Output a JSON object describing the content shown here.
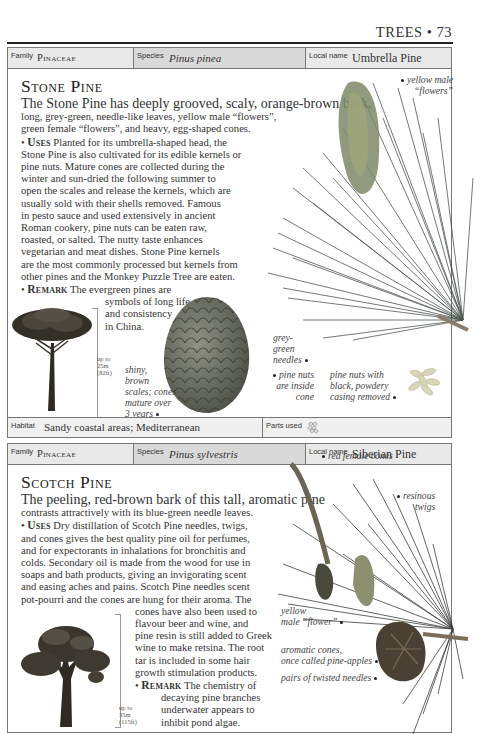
{
  "running_head": "TREES • 73",
  "entries": [
    {
      "family_label": "Family",
      "family": "Pinaceae",
      "species_label": "Species",
      "species": "Pinus pinea",
      "local_name_label": "Local name",
      "local_name": "Umbrella Pine",
      "title": "Stone Pine",
      "body_lines": [
        "The Stone Pine has deeply grooved, scaly, orange-brown bark,",
        "long, grey-green, needle-like leaves, yellow male “flowers”,",
        "green female “flowers”, and heavy, egg-shaped cones."
      ],
      "uses_keyword": "Uses",
      "uses_lines": [
        " Planted for its umbrella-shaped head, the",
        "Stone Pine is also cultivated for its edible kernels or",
        "pine nuts. Mature cones are collected during the",
        "winter and sun-dried the following summer to",
        "open the scales and release the kernels, which are",
        "usually sold with their shells removed. Famous",
        "in pesto sauce and used extensively in ancient",
        "Roman cookery, pine nuts can be eaten raw,",
        "roasted, or salted. The nutty taste enhances",
        "vegetarian and meat dishes. Stone Pine kernels",
        "are the most commonly processed but kernels from",
        "other pines and the Monkey Puzzle Tree are eaten."
      ],
      "remark_keyword": "Remark",
      "remark_first": " The evergreen pines are",
      "remark_lines": [
        "symbols of long life",
        "and consistency",
        "in China."
      ],
      "height": [
        "up to",
        "25m",
        "(82ft)"
      ],
      "captions": {
        "male_flowers": [
          "yellow male",
          "“flowers”"
        ],
        "needles": [
          "grey-",
          "green",
          "needles"
        ],
        "scales": [
          "shiny,",
          "brown",
          "scales; cones",
          "mature over",
          "3 years"
        ],
        "nuts_inside": [
          "pine nuts",
          "are inside",
          "cone"
        ],
        "nuts_removed": [
          "pine nuts with",
          "black, powdery",
          "casing removed"
        ]
      },
      "habitat_label": "Habitat",
      "habitat": "Sandy coastal areas; Mediterranean",
      "parts_used_label": "Parts used",
      "parts_used_icon": "pine-nuts-icon"
    },
    {
      "family_label": "Family",
      "family": "Pinaceae",
      "species_label": "Species",
      "species": "Pinus sylvestris",
      "local_name_label": "Local name",
      "local_name": "Siberian Pine",
      "title": "Scotch Pine",
      "body_lines": [
        "The peeling, red-brown bark of this tall, aromatic pine",
        "contrasts attractively with its blue-green needle leaves."
      ],
      "uses_keyword": "Uses",
      "uses_lines": [
        " Dry distillation of Scotch Pine needles, twigs,",
        "and cones gives the best quality pine oil for perfumes,",
        "and for expectorants in inhalations for bronchitis and",
        "colds. Secondary oil is made from the wood for use in",
        "soaps and bath products, giving an invigorating scent",
        "and easing aches and pains. Scotch Pine needles scent",
        "pot-pourri and the cones are hung for their aroma. The"
      ],
      "uses_indented_lines": [
        "cones have also been used to",
        "flavour beer and wine, and",
        "pine resin is still added to Greek",
        "wine to make retsina. The root",
        "tar is included in some hair",
        "growth stimulation products."
      ],
      "remark_keyword": "Remark",
      "remark_first": " The chemistry of",
      "remark_lines": [
        "decaying pine branches",
        "underwater appears to",
        "inhibit pond algae."
      ],
      "height": [
        "up to",
        "35m",
        "(115ft)"
      ],
      "captions": {
        "female_cones": "red female cones",
        "twigs": [
          "resinous",
          "twigs"
        ],
        "male_flower": [
          "yellow",
          "male “flower”"
        ],
        "cones": [
          "aromatic cones,",
          "once called pine-apples"
        ],
        "needles": "pairs of twisted needles"
      }
    }
  ]
}
